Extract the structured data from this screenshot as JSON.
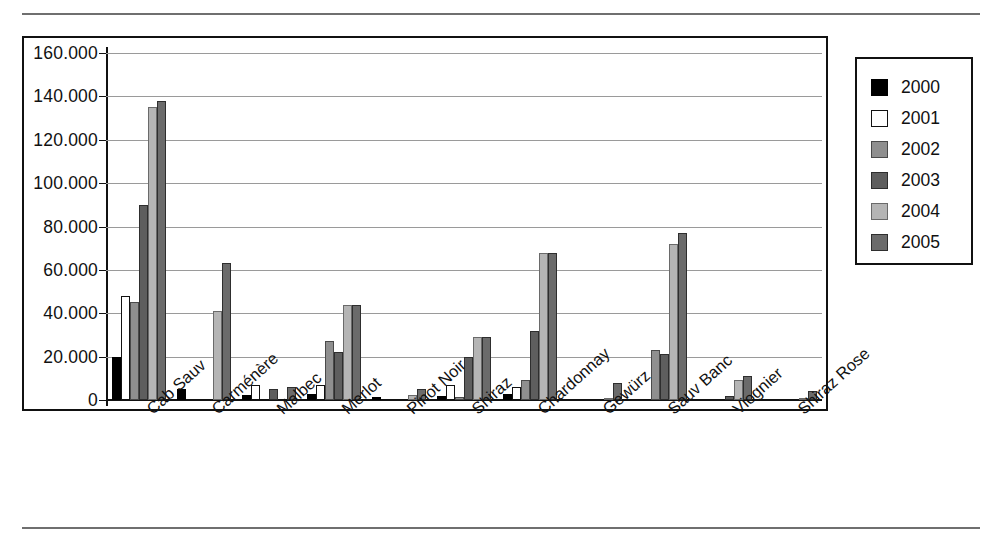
{
  "chart_data": {
    "type": "bar",
    "title": "",
    "subtitle": "",
    "xlabel": "",
    "ylabel": "",
    "grid": true,
    "legend_position": "right",
    "ylim": [
      0,
      160000
    ],
    "ytick_labels": [
      "160.000",
      "140.000",
      "120.000",
      "100.000",
      "80.000",
      "60.000",
      "40.000",
      "20.000",
      "0"
    ],
    "ytick_values": [
      160000,
      140000,
      120000,
      100000,
      80000,
      60000,
      40000,
      20000,
      0
    ],
    "categories": [
      "Cab Sauv",
      "Carménère",
      "Malbec",
      "Merlot",
      "Pinot Noir",
      "Shiraz",
      "Chardonnay",
      "Gewürz",
      "Sauv Banc",
      "Viognier",
      "Shiraz Rose"
    ],
    "series": [
      {
        "name": "2000",
        "color": "#000000",
        "values": [
          20000,
          5000,
          2500,
          3000,
          1200,
          2000,
          3000,
          0,
          0,
          0,
          0
        ]
      },
      {
        "name": "2001",
        "color": "#ffffff",
        "values": [
          48000,
          0,
          7000,
          7000,
          0,
          7000,
          6000,
          0,
          0,
          0,
          0
        ]
      },
      {
        "name": "2002",
        "color": "#8f8f8f",
        "values": [
          45000,
          0,
          0,
          27000,
          0,
          1500,
          9000,
          0,
          23000,
          0,
          0
        ]
      },
      {
        "name": "2003",
        "color": "#5e5e5e",
        "values": [
          90000,
          0,
          5000,
          22000,
          0,
          20000,
          32000,
          0,
          21000,
          2000,
          0
        ]
      },
      {
        "name": "2004",
        "color": "#b5b5b5",
        "values": [
          135000,
          41000,
          0,
          44000,
          2500,
          29000,
          68000,
          1000,
          72000,
          9000,
          1000
        ]
      },
      {
        "name": "2005",
        "color": "#6b6b6b",
        "values": [
          138000,
          63000,
          6000,
          44000,
          5000,
          29000,
          68000,
          8000,
          77000,
          11000,
          4000
        ]
      }
    ]
  }
}
